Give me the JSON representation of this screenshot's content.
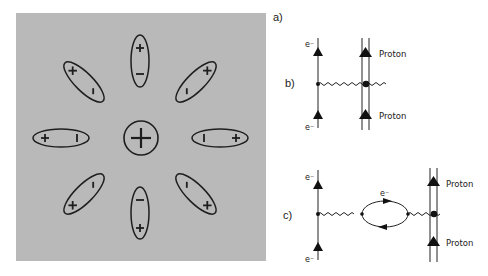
{
  "figure": {
    "left_panel": {
      "background": "#b9b9b9",
      "central_charge": {
        "symbol": "+",
        "label": "central positive charge"
      },
      "dipoles": [
        {
          "id": "top",
          "angle_deg": 90,
          "near_end": "−",
          "far_end": "+"
        },
        {
          "id": "top-right",
          "angle_deg": 45,
          "near_end": "−",
          "far_end": "×"
        },
        {
          "id": "right",
          "angle_deg": 0,
          "near_end": "−",
          "far_end": "+"
        },
        {
          "id": "bottom-right",
          "angle_deg": -45,
          "near_end": "−",
          "far_end": "×"
        },
        {
          "id": "bottom",
          "angle_deg": -90,
          "near_end": "−",
          "far_end": "+"
        },
        {
          "id": "bottom-left",
          "angle_deg": -135,
          "near_end": "−",
          "far_end": "×"
        },
        {
          "id": "left",
          "angle_deg": 180,
          "near_end": "−",
          "far_end": "+"
        },
        {
          "id": "top-left",
          "angle_deg": 135,
          "near_end": "−",
          "far_end": "×"
        }
      ]
    },
    "right_panel": {
      "labels": {
        "a": "a)",
        "b": "b)",
        "c": "c)"
      },
      "diagram_b": {
        "electron_top": "e⁻",
        "electron_bottom": "e⁻",
        "proton_top": "Proton",
        "proton_bottom": "Proton"
      },
      "diagram_c": {
        "electron_top": "e⁻",
        "electron_bottom": "e⁻",
        "loop_label": "e⁻",
        "proton_top": "Proton",
        "proton_bottom": "Proton"
      }
    }
  }
}
